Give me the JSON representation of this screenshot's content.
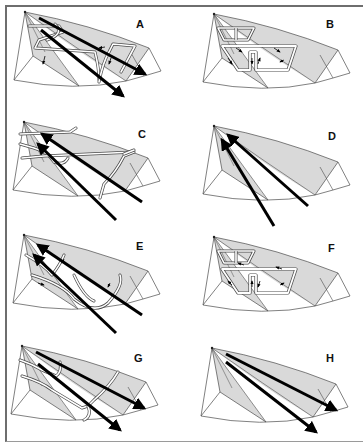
{
  "figure": {
    "layout": {
      "columns": 2,
      "rows": 4
    },
    "colors": {
      "outline": "#4a4a4a",
      "shaded_face": "#d9d9d9",
      "arrow": "#000000",
      "flow_path": "#ffffff",
      "frame": "#6e6e6e"
    },
    "panels": [
      {
        "id": "A",
        "label": "A",
        "col": 0,
        "row": 0,
        "arrows": "two long arrows",
        "flow": "looped paths on left and center faces"
      },
      {
        "id": "B",
        "label": "B",
        "col": 1,
        "row": 0,
        "arrows": "none",
        "flow": "T-shaped double cell circulation"
      },
      {
        "id": "C",
        "label": "C",
        "col": 0,
        "row": 1,
        "arrows": "two arrows pointing toward apex",
        "flow": "cross paths exiting right"
      },
      {
        "id": "D",
        "label": "D",
        "col": 1,
        "row": 1,
        "arrows": "two arrows pointing toward apex",
        "flow": "none"
      },
      {
        "id": "E",
        "label": "E",
        "col": 0,
        "row": 2,
        "arrows": "two arrows pointing toward apex",
        "flow": "U-shaped loops"
      },
      {
        "id": "F",
        "label": "F",
        "col": 1,
        "row": 2,
        "arrows": "none",
        "flow": "T-shaped double cell circulation"
      },
      {
        "id": "G",
        "label": "G",
        "col": 0,
        "row": 3,
        "arrows": "two long arrows pointing away",
        "flow": "wavy crossing paths"
      },
      {
        "id": "H",
        "label": "H",
        "col": 1,
        "row": 3,
        "arrows": "two long arrows pointing away",
        "flow": "none"
      }
    ]
  }
}
